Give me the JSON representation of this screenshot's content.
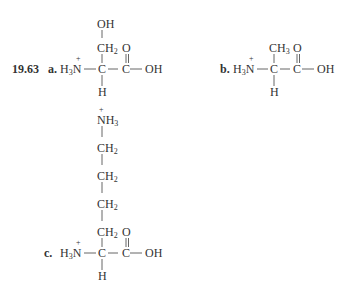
{
  "problem_number": "19.63",
  "parts": [
    {
      "label": "a.",
      "amine": "H",
      "amine_sub": "3",
      "nitrogen": "N",
      "charge": "+",
      "alpha_c": "C",
      "carboxyl_c": "C",
      "carbonyl_o": "O",
      "hydroxyl": "OH",
      "alpha_h": "H",
      "side_chain": [
        {
          "text": "OH",
          "sub": ""
        },
        {
          "text": "CH",
          "sub": "2"
        }
      ]
    },
    {
      "label": "b.",
      "amine": "H",
      "amine_sub": "3",
      "nitrogen": "N",
      "charge": "+",
      "alpha_c": "C",
      "carboxyl_c": "C",
      "carbonyl_o": "O",
      "hydroxyl": "OH",
      "alpha_h": "H",
      "side_chain": [
        {
          "text": "CH",
          "sub": "3"
        }
      ]
    },
    {
      "label": "c.",
      "amine": "H",
      "amine_sub": "3",
      "nitrogen": "N",
      "charge": "+",
      "alpha_c": "C",
      "carboxyl_c": "C",
      "carbonyl_o": "O",
      "hydroxyl": "OH",
      "alpha_h": "H",
      "side_chain": [
        {
          "text": "NH",
          "sub": "3",
          "charge": "+"
        },
        {
          "text": "CH",
          "sub": "2"
        },
        {
          "text": "CH",
          "sub": "2"
        },
        {
          "text": "CH",
          "sub": "2"
        },
        {
          "text": "CH",
          "sub": "2"
        }
      ]
    }
  ]
}
